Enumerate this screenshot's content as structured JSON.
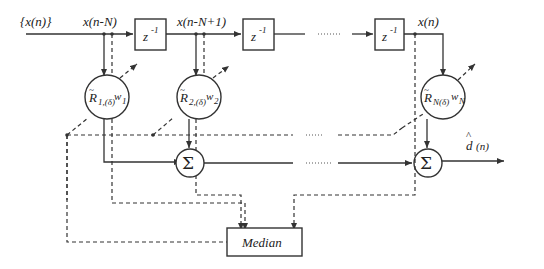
{
  "diagram": {
    "input_label": "{x(n)}",
    "taps": [
      {
        "signal": "x(n-N)",
        "weight_R": "R",
        "weight_sub": "1,(δ)",
        "weight_w": "w",
        "weight_w_sub": "1"
      },
      {
        "signal": "x(n-N+1)",
        "weight_R": "R",
        "weight_sub": "2,(δ)",
        "weight_w": "w",
        "weight_w_sub": "2"
      },
      {
        "signal": "x(n)",
        "weight_R": "R",
        "weight_sub": "N(δ)",
        "weight_w": "w",
        "weight_w_sub": "N"
      }
    ],
    "delay": {
      "base": "z",
      "exp": "-1"
    },
    "sum_symbol": "Σ",
    "output": {
      "label": "d",
      "hat": "^",
      "arg": "(n)"
    },
    "median_label": "Median",
    "ellipsis": "......"
  }
}
